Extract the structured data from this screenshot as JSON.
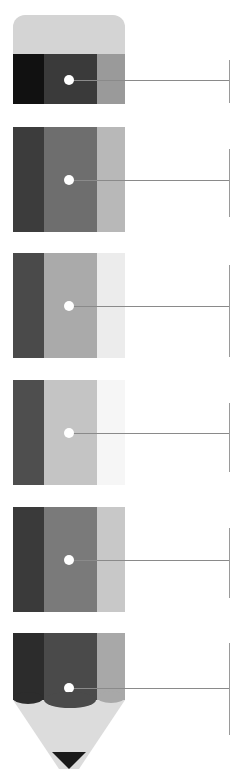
{
  "diagram": {
    "type": "pencil-infographic",
    "cap_color": "#d4d4d4",
    "sections": [
      {
        "top": 54,
        "height": 50,
        "colors": [
          "#111111",
          "#3a3a3a",
          "#9a9a9a"
        ],
        "dot_y": 80,
        "bracket_top": 60,
        "bracket_bottom": 103
      },
      {
        "top": 127,
        "height": 105,
        "colors": [
          "#3c3c3c",
          "#6e6e6e",
          "#b8b8b8"
        ],
        "dot_y": 180,
        "bracket_top": 149,
        "bracket_bottom": 217
      },
      {
        "top": 253,
        "height": 105,
        "colors": [
          "#4a4a4a",
          "#aaaaaa",
          "#ececec"
        ],
        "dot_y": 306,
        "bracket_top": 265,
        "bracket_bottom": 357
      },
      {
        "top": 380,
        "height": 105,
        "colors": [
          "#4e4e4e",
          "#c4c4c4",
          "#f6f6f6"
        ],
        "dot_y": 433,
        "bracket_top": 403,
        "bracket_bottom": 472
      },
      {
        "top": 507,
        "height": 105,
        "colors": [
          "#3a3a3a",
          "#7a7a7a",
          "#c8c8c8"
        ],
        "dot_y": 560,
        "bracket_top": 528,
        "bracket_bottom": 598
      },
      {
        "top": 633,
        "height": 67,
        "colors": [
          "#2c2c2c",
          "#4a4a4a",
          "#a8a8a8"
        ],
        "dot_y": 688,
        "bracket_top": 643,
        "bracket_bottom": 735
      }
    ],
    "tip": {
      "wood_color": "#dcdcdc",
      "lead_color": "#1a1a1a"
    }
  }
}
